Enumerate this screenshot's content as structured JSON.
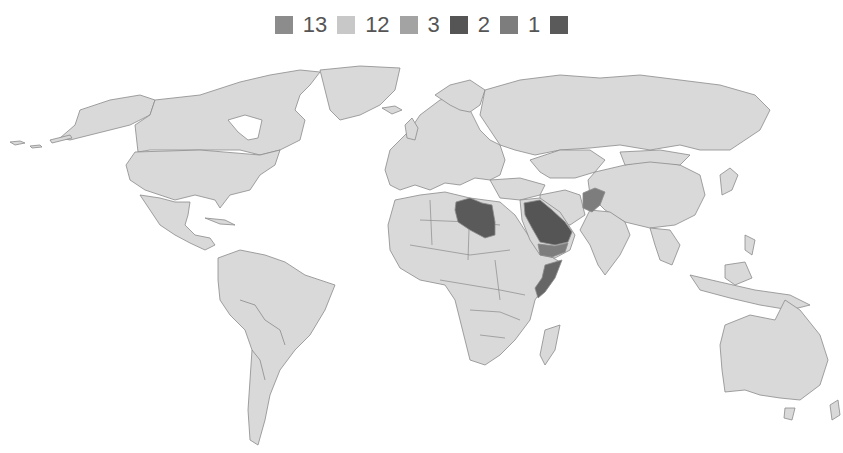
{
  "legend": {
    "items": [
      {
        "label": "",
        "color": "#8c8c8c"
      },
      {
        "label": "13",
        "color": "#c8c8c8"
      },
      {
        "label": "12",
        "color": "#a3a3a3"
      },
      {
        "label": "3",
        "color": "#555555"
      },
      {
        "label": "2",
        "color": "#7d7d7d"
      },
      {
        "label": "1",
        "color": "#5a5a5a"
      }
    ],
    "labels_in_order": [
      "13",
      "12",
      "3",
      "2",
      "1"
    ]
  },
  "map": {
    "type": "choropleth world map",
    "base_color": "#d9d9d9",
    "border_color": "#8a8a8a",
    "highlighted_countries": [
      {
        "name": "Libya",
        "color": "#5a5a5a"
      },
      {
        "name": "Saudi Arabia",
        "color": "#5a5a5a"
      },
      {
        "name": "Yemen",
        "color": "#7d7d7d"
      },
      {
        "name": "Afghanistan",
        "color": "#7d7d7d"
      },
      {
        "name": "Somalia",
        "color": "#666666"
      }
    ]
  }
}
